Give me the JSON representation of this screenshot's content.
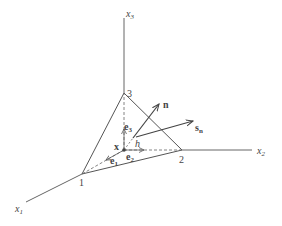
{
  "diagram": {
    "type": "tetrahedron-coordinate-diagram",
    "axes": [
      {
        "name": "x1",
        "label": "x",
        "subscript": "1"
      },
      {
        "name": "x2",
        "label": "x",
        "subscript": "2"
      },
      {
        "name": "x3",
        "label": "x",
        "subscript": "3"
      }
    ],
    "vertices": [
      {
        "id": "1",
        "label": "1"
      },
      {
        "id": "2",
        "label": "2"
      },
      {
        "id": "3",
        "label": "3"
      }
    ],
    "origin_point": {
      "label": "x"
    },
    "unit_vectors": [
      {
        "label": "e",
        "subscript": "1"
      },
      {
        "label": "e",
        "subscript": "2"
      },
      {
        "label": "e",
        "subscript": "3"
      }
    ],
    "vectors": [
      {
        "name": "normal",
        "label": "n",
        "subscript": ""
      },
      {
        "name": "traction",
        "label": "s",
        "subscript": "n"
      }
    ],
    "distance": {
      "label": "h"
    },
    "colors": {
      "line": "#555555",
      "text": "#444444",
      "background": "#ffffff"
    }
  }
}
